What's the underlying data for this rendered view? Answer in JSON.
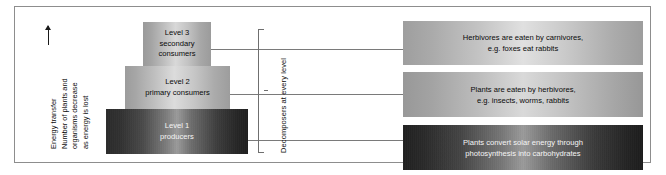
{
  "diagram": {
    "axis_caption": {
      "line1": "Energy transfer",
      "line2": "Number of plants and",
      "line3": "organisms decrease",
      "line4": "as energy is lost",
      "arrow": "up-arrow"
    },
    "bracket_label": "Decomposers at every level",
    "pyramid": [
      {
        "id": "level-3",
        "line1": "Level 3",
        "line2": "secondary",
        "line3": "consumers"
      },
      {
        "id": "level-2",
        "line1": "Level 2",
        "line2": "primary consumers",
        "line3": ""
      },
      {
        "id": "level-1",
        "line1": "Level 1",
        "line2": "producers",
        "line3": ""
      }
    ],
    "info_boxes": [
      {
        "id": "box-carnivores",
        "line1": "Herbivores are eaten by carnivores,",
        "line2": "e.g. foxes eat rabbits"
      },
      {
        "id": "box-herbivores",
        "line1": "Plants are eaten by herbivores,",
        "line2": "e.g. insects, worms, rabbits"
      },
      {
        "id": "box-producers",
        "line1": "Plants convert solar energy through",
        "line2": "photosynthesis into carbohydrates"
      }
    ]
  }
}
